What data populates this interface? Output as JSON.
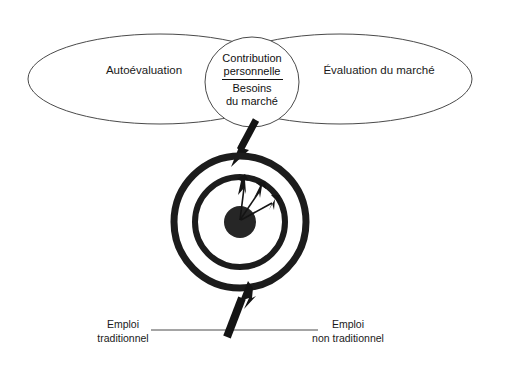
{
  "diagram": {
    "title_text": "",
    "venn": {
      "left_ellipse_label": "Autoévaluation",
      "right_ellipse_label": "Évaluation du marché",
      "center_ellipse": {
        "numerator_line1": "Contribution",
        "numerator_line2": "personnelle",
        "denominator_line1": "Besoins",
        "denominator_line2": "du marché"
      }
    },
    "target": {
      "arrow_count": 3,
      "ring_count": 2,
      "bullseye_present": true
    },
    "axis": {
      "left_label_line1": "Emploi",
      "left_label_line2": "traditionnel",
      "right_label_line1": "Emploi",
      "right_label_line2": "non traditionnel"
    },
    "colors": {
      "ink": "#141414",
      "outline": "#4a4a4a",
      "bullseye": "#262626",
      "background": "#ffffff"
    }
  }
}
